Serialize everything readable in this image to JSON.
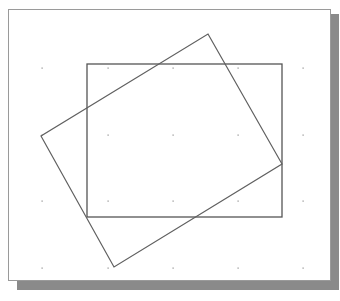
{
  "diagram": {
    "canvas": {
      "x": 8,
      "y": 9,
      "width": 322,
      "height": 271,
      "border_color": "#9a9a9a",
      "shadow_color": "#8a8a8a"
    },
    "grid_dots": {
      "xs": [
        42,
        108,
        173,
        238,
        303
      ],
      "ys": [
        68,
        135,
        201,
        268
      ],
      "color": "#8c8c8c"
    },
    "shapes": [
      {
        "name": "upright-rectangle",
        "type": "rect",
        "x": 87,
        "y": 64,
        "width": 195,
        "height": 153,
        "stroke": "#555555"
      },
      {
        "name": "rotated-rectangle",
        "type": "polygon",
        "points": [
          [
            208,
            34
          ],
          [
            282,
            164
          ],
          [
            114,
            267
          ],
          [
            41,
            136
          ]
        ],
        "stroke": "#606060"
      }
    ]
  }
}
